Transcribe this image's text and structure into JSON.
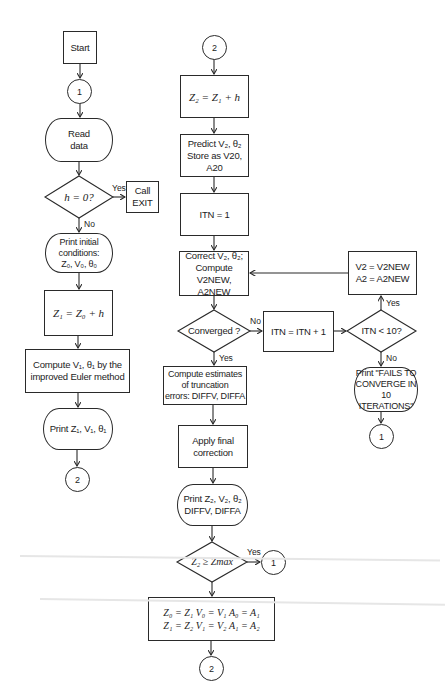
{
  "flowchart": {
    "left_column": {
      "start": "Start",
      "connector_1": "1",
      "read_data": "Read\ndata",
      "decision_h": "h = 0?",
      "decision_h_yes": "Yes",
      "decision_h_no": "No",
      "call_exit": "Call\nEXIT",
      "print_initial": "Print initial\nconditions:\nZ₀, V₀, θ₀",
      "z1_assign": "Z₁ = Z₀ + h",
      "compute_v1": "Compute V₁, θ₁ by the\nimproved Euler method",
      "print_z1": "Print Z₁, V₁, θ₁",
      "connector_2": "2"
    },
    "right_column": {
      "connector_2": "2",
      "z2_assign": "Z₂ = Z₁ + h",
      "predict": "Predict V₂, θ₂\nStore as V20, A20",
      "itn_init": "ITN = 1",
      "correct": "Correct V₂, θ₂;\nCompute V2NEW,\nA2NEW",
      "decision_converged": "Converged ?",
      "decision_converged_no": "No",
      "decision_converged_yes": "Yes",
      "compute_estimates": "Compute estimates\nof truncation\nerrors: DIFFV, DIFFA",
      "apply_final": "Apply final\ncorrection",
      "print_z2": "Print Z₂, V₂, θ₂\nDIFFV, DIFFA",
      "decision_zmax": "Z₂ ≥ Zmax",
      "decision_zmax_yes": "Yes",
      "connector_1": "1",
      "shift_values": "Z₀ = Z₁   V₀ = V₁   A₀ = A₁\nZ₁ = Z₂   V₁ = V₂   A₁ = A₂",
      "connector_2_bottom": "2"
    },
    "iteration_branch": {
      "itn_increment": "ITN = ITN + 1",
      "decision_itn": "ITN < 10?",
      "decision_itn_yes": "Yes",
      "decision_itn_no": "No",
      "v2_assign": "V2 = V2NEW\nA2 = A2NEW",
      "print_fail": "Print \"FAILS TO\nCONVERGE IN\n10 ITERATIONS\"",
      "connector_1": "1"
    }
  },
  "colors": {
    "line": "#2a2a2a",
    "background": "#ffffff",
    "text": "#1c1c1c"
  }
}
